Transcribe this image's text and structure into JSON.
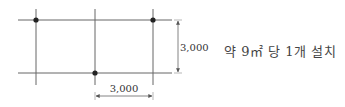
{
  "diagram": {
    "type": "grid-spacing-plan",
    "grid": {
      "horizontal_lines_y": [
        20,
        73
      ],
      "vertical_lines_x": [
        36,
        95,
        153
      ],
      "line_color": "#555555"
    },
    "points": [
      {
        "x": 36,
        "y": 20
      },
      {
        "x": 153,
        "y": 20
      },
      {
        "x": 95,
        "y": 73
      }
    ],
    "dimensions": {
      "vertical": {
        "value": "3,000"
      },
      "horizontal": {
        "value": "3,000"
      }
    },
    "label": "약 9㎡ 당 1개 설치"
  }
}
